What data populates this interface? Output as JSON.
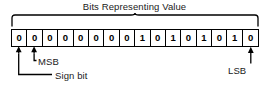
{
  "diagram": {
    "title": "Bits Representing Value",
    "bits": [
      "0",
      "0",
      "0",
      "0",
      "0",
      "0",
      "0",
      "0",
      "1",
      "0",
      "1",
      "0",
      "1",
      "0",
      "1",
      "0"
    ],
    "labels": {
      "msb": "MSB",
      "sign_bit": "Sign bit",
      "lsb": "LSB"
    },
    "colors": {
      "ink": "#000000",
      "text": "#1a1a1a",
      "background": "#ffffff"
    }
  }
}
